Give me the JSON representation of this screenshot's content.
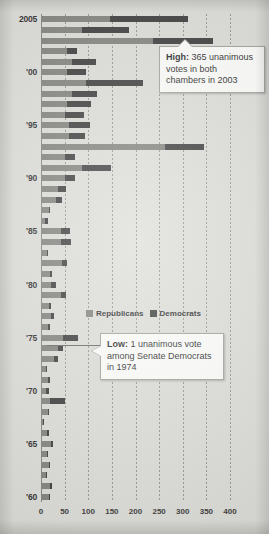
{
  "chart_data": {
    "type": "bar",
    "orientation": "horizontal",
    "stacked": true,
    "title": "",
    "subtitle": "",
    "xlabel": "",
    "ylabel": "",
    "xlim": [
      0,
      400
    ],
    "xticks": [
      0,
      50,
      100,
      150,
      200,
      250,
      300,
      350,
      400
    ],
    "xtick_labels": [
      "0",
      "50",
      "100",
      "150",
      "200",
      "250",
      "300",
      "350",
      "400"
    ],
    "ytick_labels": [
      "2005",
      "'00",
      "'95",
      "'90",
      "'85",
      "'80",
      "'75",
      "'70",
      "'65",
      "'60"
    ],
    "grid": "vertical-dotted",
    "legend_position": "inside-center",
    "series": [
      {
        "name": "Republicans",
        "color": "#767672",
        "values": [
          146,
          86,
          238,
          56,
          66,
          56,
          96,
          66,
          56,
          50,
          60,
          60,
          262,
          50,
          86,
          50,
          36,
          32,
          16,
          8,
          42,
          42,
          12,
          44,
          18,
          22,
          42,
          16,
          22,
          14,
          46,
          36,
          28,
          10,
          14,
          10,
          18,
          14,
          4,
          12,
          22,
          12,
          16,
          10,
          20,
          16
        ]
      },
      {
        "name": "Democrats",
        "color": "#2b2b2b",
        "values": [
          165,
          100,
          127,
          20,
          50,
          40,
          120,
          52,
          50,
          40,
          44,
          34,
          84,
          22,
          62,
          22,
          16,
          12,
          2,
          6,
          20,
          22,
          2,
          10,
          6,
          10,
          10,
          6,
          6,
          6,
          32,
          10,
          8,
          2,
          6,
          6,
          32,
          2,
          1,
          4,
          4,
          2,
          4,
          2,
          4,
          2
        ]
      }
    ],
    "categories": [
      "2005",
      "2004",
      "2003",
      "2002",
      "2001",
      "2000",
      "1999",
      "1998",
      "1997",
      "1996",
      "1995",
      "1994",
      "1993",
      "1992",
      "1991",
      "1990",
      "1989",
      "1988",
      "1987",
      "1986",
      "1985",
      "1984",
      "1983",
      "1982",
      "1981",
      "1980",
      "1979",
      "1978",
      "1977",
      "1976",
      "1975",
      "1974",
      "1973",
      "1972",
      "1971",
      "1970",
      "1969",
      "1968",
      "1967",
      "1966",
      "1965",
      "1964",
      "1963",
      "1962",
      "1961",
      "1960"
    ],
    "annotations": [
      {
        "id": "high",
        "bold_prefix": "High:",
        "text": " 365 unanimous votes in both chambers in 2003",
        "full_text": "High: 365 unanimous votes in both chambers in 2003",
        "value": 365,
        "year": 2003
      },
      {
        "id": "low",
        "bold_prefix": "Low:",
        "text": " 1 unanimous vote among Senate Democrats in 1974",
        "full_text": "Low: 1 unanimous vote among Senate Democrats in 1974",
        "value": 1,
        "year": 1974
      }
    ]
  },
  "legend": {
    "republicans_label": "Republicans",
    "democrats_label": "Democrats",
    "republicans_color": "#767672",
    "democrats_color": "#2b2b2b"
  },
  "callouts": {
    "high": {
      "label": "High:",
      "body": " 365 unanimous votes in both chambers in 2003"
    },
    "low": {
      "label": "Low:",
      "body": " 1 unanimous vote among Senate Democrats in 1974"
    }
  },
  "axis": {
    "x_ticks": [
      "0",
      "50",
      "100",
      "150",
      "200",
      "250",
      "300",
      "350",
      "400"
    ],
    "y_ticks": [
      "2005",
      "'00",
      "'95",
      "'90",
      "'85",
      "'80",
      "'75",
      "'70",
      "'65",
      "'60"
    ]
  }
}
